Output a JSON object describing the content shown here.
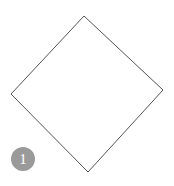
{
  "diagram": {
    "shape": "diamond",
    "stroke_color": "#555555",
    "fill_color": "#ffffff",
    "points": [
      [
        84,
        16
      ],
      [
        163,
        90
      ],
      [
        88,
        172
      ],
      [
        11,
        94
      ]
    ]
  },
  "badge": {
    "label": "1",
    "color": "#9a9a9a"
  }
}
